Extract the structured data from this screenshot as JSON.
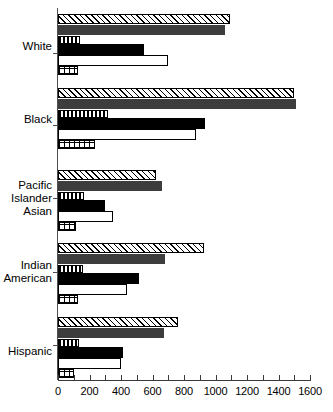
{
  "chart_data": {
    "type": "bar",
    "orientation": "horizontal",
    "title": "",
    "xlabel": "",
    "ylabel": "",
    "xlim": [
      0,
      1600
    ],
    "xticks": [
      0,
      200,
      400,
      600,
      800,
      1000,
      1200,
      1400,
      1600
    ],
    "xtick_labels": [
      "0",
      "200",
      "400",
      "600",
      "800",
      "1000",
      "1200",
      "1400",
      "1600"
    ],
    "minor_tick_step": 100,
    "grid": false,
    "legend": "none",
    "categories": [
      "White",
      "Black",
      "Pacific Islander Asian",
      "Indian American",
      "Hispanic"
    ],
    "series": [
      {
        "name": "series-1",
        "pattern": "diagonal-hatch",
        "values": [
          1090,
          1500,
          620,
          925,
          760
        ]
      },
      {
        "name": "series-2",
        "pattern": "solid-dark-gray",
        "values": [
          1060,
          1510,
          660,
          680,
          670
        ]
      },
      {
        "name": "series-3",
        "pattern": "vertical-stripes",
        "values": [
          140,
          320,
          165,
          160,
          135
        ]
      },
      {
        "name": "series-4",
        "pattern": "solid-black",
        "values": [
          545,
          935,
          300,
          515,
          415
        ]
      },
      {
        "name": "series-5",
        "pattern": "white-outline",
        "values": [
          700,
          875,
          350,
          440,
          400
        ]
      },
      {
        "name": "series-6",
        "pattern": "cross-hatch-grid",
        "values": [
          125,
          235,
          115,
          125,
          100
        ]
      }
    ]
  },
  "axis": {
    "tick_labels": [
      "0",
      "200",
      "400",
      "600",
      "800",
      "1000",
      "1200",
      "1400",
      "1600"
    ]
  },
  "categories": {
    "white": "White",
    "black": "Black",
    "pacific_line1": "Pacific",
    "pacific_line2": "Islander",
    "pacific_line3": "Asian",
    "indian_line1": "Indian",
    "indian_line2": "American",
    "hispanic": "Hispanic"
  }
}
